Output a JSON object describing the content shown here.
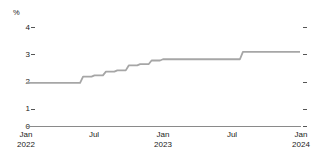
{
  "chart_data": {
    "type": "line",
    "title": "",
    "subtitle": "",
    "xlabel": "",
    "ylabel": "%",
    "y_unit_label": "%",
    "ylim": [
      0,
      4.3
    ],
    "yticks": [
      0,
      1,
      2,
      3,
      4
    ],
    "ytick_labels": [
      "0",
      "1",
      "2",
      "3",
      "4"
    ],
    "grid": false,
    "legend": null,
    "line_color": "#a6a6a6",
    "axis_color": "#8a8a8a",
    "text_color": "#222222",
    "step_style": "post",
    "x_axis_range": [
      "2022-01",
      "2024-01"
    ],
    "xticks": [
      "2022-01",
      "2022-07",
      "2023-01",
      "2023-07",
      "2024-01"
    ],
    "xtick_labels": [
      {
        "month": "Jan",
        "year": "2022"
      },
      {
        "month": "Jul",
        "year": ""
      },
      {
        "month": "Jan",
        "year": "2023"
      },
      {
        "month": "Jul",
        "year": ""
      },
      {
        "month": "Jan",
        "year": "2024"
      }
    ],
    "x": [
      "2022-01",
      "2022-02",
      "2022-03",
      "2022-04",
      "2022-05",
      "2022-06",
      "2022-07",
      "2022-08",
      "2022-09",
      "2022-10",
      "2022-11",
      "2022-12",
      "2023-01",
      "2023-02",
      "2023-03",
      "2023-04",
      "2023-05",
      "2023-06",
      "2023-07",
      "2023-08",
      "2023-09",
      "2023-10",
      "2023-11",
      "2023-12",
      "2024-01"
    ],
    "values": [
      1.75,
      1.75,
      1.75,
      1.75,
      1.75,
      2.0,
      2.05,
      2.2,
      2.25,
      2.45,
      2.5,
      2.65,
      2.7,
      2.7,
      2.7,
      2.7,
      2.7,
      2.7,
      2.7,
      3.0,
      3.0,
      3.0,
      3.0,
      3.0,
      3.0
    ],
    "series": [
      {
        "name": "rate",
        "color": "#a6a6a6",
        "values": [
          1.75,
          1.75,
          1.75,
          1.75,
          1.75,
          2.0,
          2.05,
          2.2,
          2.25,
          2.45,
          2.5,
          2.65,
          2.7,
          2.7,
          2.7,
          2.7,
          2.7,
          2.7,
          2.7,
          3.0,
          3.0,
          3.0,
          3.0,
          3.0,
          3.0
        ]
      }
    ],
    "annotations": []
  },
  "axes": {
    "y_unit": "%",
    "y_labels": [
      "4",
      "3",
      "2",
      "1",
      "0"
    ],
    "x_labels": [
      {
        "month": "Jan",
        "year": "2022"
      },
      {
        "month": "Jul",
        "year": ""
      },
      {
        "month": "Jan",
        "year": "2023"
      },
      {
        "month": "Jul",
        "year": ""
      },
      {
        "month": "Jan",
        "year": "2024"
      }
    ]
  }
}
